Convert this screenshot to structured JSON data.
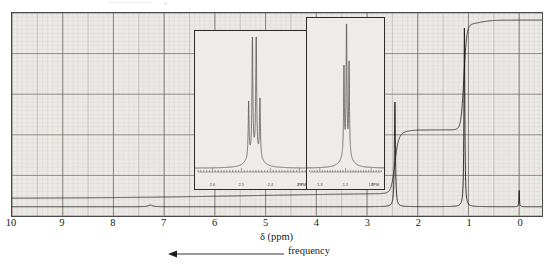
{
  "figure": {
    "kind": "nmr-spectrum",
    "background_color": "#eceae6",
    "frame_color": "#4a4a4a",
    "trace_color": "#1d1d1d",
    "grid_major_color": "#8e8b86",
    "grid_minor_color": "#bdbab5"
  },
  "axis": {
    "title": "δ (ppm)",
    "tick_labels": [
      "10",
      "9",
      "8",
      "7",
      "6",
      "5",
      "4",
      "3",
      "2",
      "1",
      "0"
    ],
    "direction_note": "frequency",
    "arrow_direction": "left"
  },
  "insets": [
    {
      "name": "inset-expansion-2.45ppm",
      "tick_labels": [
        "2.6",
        "2.5",
        "2.4",
        "2.3",
        "PPM"
      ],
      "multiplet": "quartet (partially resolved)"
    },
    {
      "name": "inset-expansion-1.08ppm",
      "tick_labels": [
        "1.3",
        "1.2",
        "1.1",
        "PPM"
      ],
      "multiplet": "doublet"
    }
  ],
  "chart_data": {
    "type": "line",
    "title": "",
    "subtitle": "",
    "xlabel": "δ (ppm)",
    "ylabel": "",
    "xlim": [
      10,
      -0.45
    ],
    "ylim": [
      0,
      1
    ],
    "grid": true,
    "legend": null,
    "xticks": [
      10,
      9,
      8,
      7,
      6,
      5,
      4,
      3,
      2,
      1,
      0
    ],
    "annotations": [
      {
        "text": "frequency",
        "arrow": "left",
        "position": "below-axis"
      }
    ],
    "series": [
      {
        "name": "spectrum",
        "type": "line",
        "peaks": [
          {
            "ppm": 2.45,
            "height": 0.55,
            "width": 0.012,
            "label": "CH (septet region)"
          },
          {
            "ppm": 1.08,
            "height": 0.93,
            "width": 0.01,
            "label": "CH3 doublet"
          },
          {
            "ppm": 0.0,
            "height": 0.085,
            "width": 0.006,
            "label": "TMS"
          }
        ],
        "baseline": 0.012
      },
      {
        "name": "integration",
        "type": "step",
        "steps": [
          {
            "ppm_start": 10.0,
            "ppm_end": 2.6,
            "level": 0.055
          },
          {
            "ppm_start": 2.6,
            "ppm_end": 2.32,
            "level": 0.345
          },
          {
            "ppm_start": 2.32,
            "ppm_end": 1.22,
            "level": 0.385
          },
          {
            "ppm_start": 1.22,
            "ppm_end": 0.92,
            "level": 0.93
          },
          {
            "ppm_start": 0.92,
            "ppm_end": -0.45,
            "level": 0.955
          }
        ]
      }
    ],
    "inset_a": {
      "type": "line",
      "xlim": [
        2.66,
        2.26
      ],
      "xticks": [
        2.6,
        2.5,
        2.4,
        2.3
      ],
      "xtick_labels": [
        "2.6",
        "2.5",
        "2.4",
        "2.3"
      ],
      "unit_label": "PPM",
      "peaks": [
        {
          "ppm": 2.475,
          "height": 0.42
        },
        {
          "ppm": 2.462,
          "height": 0.88
        },
        {
          "ppm": 2.449,
          "height": 0.97
        },
        {
          "ppm": 2.436,
          "height": 0.44
        }
      ]
    },
    "inset_b": {
      "type": "line",
      "xlim": [
        1.35,
        1.05
      ],
      "xticks": [
        1.3,
        1.2,
        1.1
      ],
      "xtick_labels": [
        "1.3",
        "1.2",
        "1.1"
      ],
      "unit_label": "PPM",
      "peaks": [
        {
          "ppm": 1.206,
          "height": 0.6
        },
        {
          "ppm": 1.196,
          "height": 0.96
        },
        {
          "ppm": 1.186,
          "height": 0.63
        }
      ]
    }
  }
}
